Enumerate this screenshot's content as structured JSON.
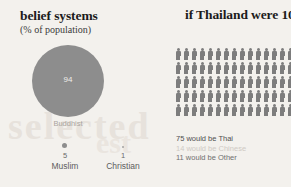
{
  "left_panel": {
    "title": "belief systems",
    "subtitle": "(% of population)",
    "buddhist": {
      "value": "94",
      "label": "Buddhist"
    },
    "muslim": {
      "value": "5",
      "label": "Muslim"
    },
    "christian": {
      "value": "1",
      "label": "Christian"
    }
  },
  "right_panel": {
    "title": "if Thailand were 100 people",
    "legend": {
      "thai": "75 would be Thai",
      "chinese": "14 would be Chinese",
      "other": "11 would be Other"
    }
  },
  "watermark": {
    "text": "selected",
    "text2": "est"
  },
  "chart_data": [
    {
      "type": "pie",
      "title": "belief systems",
      "subtitle": "(% of population)",
      "xlabel": "",
      "ylabel": "% of population",
      "categories": [
        "Buddhist",
        "Muslim",
        "Christian"
      ],
      "values": [
        94,
        5,
        1
      ],
      "units": "percent",
      "legend_position": "below-bubbles",
      "grid": false,
      "note": "proportional-area circles, not a true pie; areas scale with percentage"
    },
    {
      "type": "bar",
      "title": "if Thailand were 100 people",
      "xlabel": "",
      "ylabel": "people per 100",
      "categories": [
        "Thai",
        "Chinese",
        "Other"
      ],
      "values": [
        75,
        14,
        11
      ],
      "ylim": [
        0,
        100
      ],
      "grid": false,
      "legend_position": "below",
      "annotations": [
        "75 would be Thai",
        "14 would be Chinese",
        "11 would be Other"
      ],
      "note": "isotype pictogram, 100 person icons arranged in 5 rows of 20"
    }
  ],
  "pictogram": {
    "rows": 5,
    "columns": 20,
    "total": 100
  }
}
